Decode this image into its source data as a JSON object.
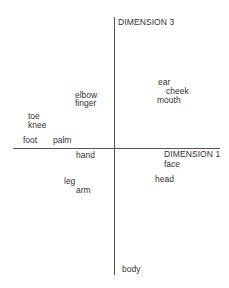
{
  "chart_data": {
    "type": "scatter",
    "title": "",
    "xlabel": "DIMENSION 1",
    "ylabel": "DIMENSION 3",
    "grid": false,
    "legend": null,
    "axis_origin_px": {
      "x": 114,
      "y": 148
    },
    "axes": {
      "vertical": {
        "x": 114,
        "y_top": 17,
        "y_bottom": 275,
        "label": "DIMENSION 3",
        "label_pos": {
          "x": 118,
          "y": 17
        }
      },
      "horizontal": {
        "y": 148,
        "x_left": 13,
        "x_right": 220,
        "label": "DIMENSION 1",
        "label_pos": {
          "x": 164,
          "y": 149
        }
      }
    },
    "points": [
      {
        "label": "ear",
        "x": 158,
        "y": 77
      },
      {
        "label": "cheek",
        "x": 166,
        "y": 86
      },
      {
        "label": "mouth",
        "x": 157,
        "y": 95
      },
      {
        "label": "elbow",
        "x": 75,
        "y": 90
      },
      {
        "label": "finger",
        "x": 75,
        "y": 98
      },
      {
        "label": "toe",
        "x": 28,
        "y": 111
      },
      {
        "label": "knee",
        "x": 28,
        "y": 120
      },
      {
        "label": "foot",
        "x": 23,
        "y": 135
      },
      {
        "label": "palm",
        "x": 53,
        "y": 135
      },
      {
        "label": "hand",
        "x": 76,
        "y": 150
      },
      {
        "label": "face",
        "x": 164,
        "y": 159
      },
      {
        "label": "head",
        "x": 155,
        "y": 174
      },
      {
        "label": "leg",
        "x": 64,
        "y": 176
      },
      {
        "label": "arm",
        "x": 76,
        "y": 185
      },
      {
        "label": "body",
        "x": 122,
        "y": 264
      }
    ]
  }
}
